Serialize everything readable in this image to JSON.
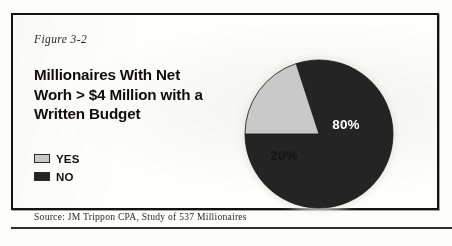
{
  "figure": {
    "label": "Figure 3-2",
    "title": "Millionaires With Net Worh > $4 Million with a Written Budget",
    "source": "Source: JM Trippon CPA, Study of 537 Millionaires"
  },
  "legend": {
    "items": [
      {
        "label": "YES",
        "color": "#c9c9c9",
        "swatch_name": "legend-swatch-yes"
      },
      {
        "label": "NO",
        "color": "#242424",
        "swatch_name": "legend-swatch-no"
      }
    ]
  },
  "colors": {
    "yes": "#c9c9c9",
    "no": "#242424",
    "frame": "#15130f",
    "paper": "#fefefc",
    "label_light": "#ffffff",
    "label_dark": "#141414"
  },
  "chart_data": {
    "type": "pie",
    "title": "Millionaires With Net Worh > $4 Million with a Written Budget",
    "categories": [
      "NO",
      "YES"
    ],
    "values": [
      80,
      20
    ],
    "unit": "%",
    "data_labels": [
      "80%",
      "20%"
    ],
    "legend_position": "left",
    "grid": false,
    "series": [
      {
        "name": "Millionaires with a written budget",
        "slices": [
          {
            "name": "NO",
            "value": 80,
            "label": "80%",
            "color": "#242424",
            "label_color": "#ffffff"
          },
          {
            "name": "YES",
            "value": 20,
            "label": "20%",
            "color": "#c9c9c9",
            "label_color": "#141414"
          }
        ]
      }
    ],
    "source": "Source: JM Trippon CPA, Study of 537 Millionaires",
    "sample_size": 537,
    "start_angle_deg": 180,
    "direction": "counterclockwise"
  }
}
